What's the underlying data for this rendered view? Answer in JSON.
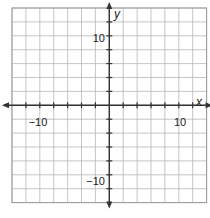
{
  "chart_data": {
    "type": "scatter",
    "title": "",
    "xlabel": "x",
    "ylabel": "y",
    "xlim": [
      -14,
      14
    ],
    "ylim": [
      -14,
      14
    ],
    "grid": true,
    "grid_step": 2,
    "tick_step": 2,
    "labeled_ticks": {
      "x": [
        -10,
        10
      ],
      "y": [
        10,
        -10
      ]
    },
    "tick_labels": {
      "x_neg": "−10",
      "x_pos": "10",
      "y_pos": "10",
      "y_neg": "−10"
    },
    "points": [],
    "legend": null
  },
  "colors": {
    "grid": "#b8b8b8",
    "axis": "#333333",
    "border": "#999999",
    "background": "#ffffff"
  }
}
